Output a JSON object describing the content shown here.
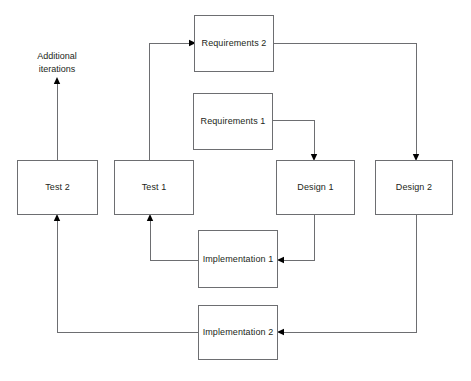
{
  "diagram": {
    "stroke_color": "#6d6e71",
    "text_color": "#231f20",
    "background_color": "#ffffff",
    "annotation": {
      "line1": "Additional",
      "line2": "iterations"
    },
    "nodes": [
      {
        "id": "requirements-2",
        "label": "Requirements 2",
        "x": 194,
        "y": 15,
        "w": 80,
        "h": 57
      },
      {
        "id": "requirements-1",
        "label": "Requirements 1",
        "x": 193,
        "y": 93,
        "w": 80,
        "h": 57
      },
      {
        "id": "test-2",
        "label": "Test 2",
        "x": 17,
        "y": 160,
        "w": 81,
        "h": 55
      },
      {
        "id": "test-1",
        "label": "Test 1",
        "x": 114,
        "y": 160,
        "w": 80,
        "h": 55
      },
      {
        "id": "design-1",
        "label": "Design 1",
        "x": 276,
        "y": 160,
        "w": 79,
        "h": 55
      },
      {
        "id": "design-2",
        "label": "Design 2",
        "x": 375,
        "y": 160,
        "w": 78,
        "h": 55
      },
      {
        "id": "implementation-1",
        "label": "Implementation 1",
        "x": 198,
        "y": 230,
        "w": 80,
        "h": 58
      },
      {
        "id": "implementation-2",
        "label": "Implementation 2",
        "x": 198,
        "y": 305,
        "w": 80,
        "h": 55
      }
    ],
    "edges": [
      {
        "id": "test1-to-requirements2",
        "from": "test-1",
        "to": "requirements-2",
        "points": "149,160 149,43 189,43",
        "arrow": "right"
      },
      {
        "id": "requirements2-to-design2",
        "from": "requirements-2",
        "to": "design-2",
        "points": "274,43 416,43 416,154",
        "arrow": "down"
      },
      {
        "id": "requirements1-to-design1",
        "from": "requirements-1",
        "to": "design-1",
        "points": "273,120 314,120 314,154",
        "arrow": "down"
      },
      {
        "id": "design1-to-implementation1",
        "from": "design-1",
        "to": "implementation-1",
        "points": "314,215 314,260 284,260",
        "arrow": "left"
      },
      {
        "id": "implementation1-to-test1",
        "from": "implementation-1",
        "to": "test-1",
        "points": "198,260 150,260 150,221",
        "arrow": "up"
      },
      {
        "id": "design2-to-implementation2",
        "from": "design-2",
        "to": "implementation-2",
        "points": "416,215 416,332 284,332",
        "arrow": "left"
      },
      {
        "id": "implementation2-to-test2",
        "from": "implementation-2",
        "to": "test-2",
        "points": "198,332 57,332 57,221",
        "arrow": "up"
      },
      {
        "id": "test2-to-additional-iterations",
        "from": "test-2",
        "to": "additional-iterations",
        "points": "57,160 57,84",
        "arrow": "up"
      }
    ]
  }
}
